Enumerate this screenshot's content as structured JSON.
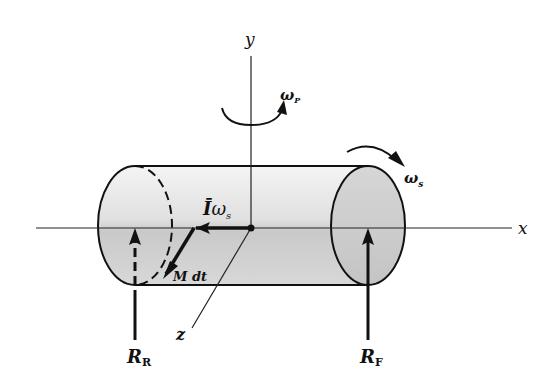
{
  "figure": {
    "axes": {
      "x_label": "x",
      "y_label": "y",
      "z_label": "z"
    },
    "vectors": {
      "angular_momentum": {
        "symbol": "Ī",
        "subscript_symbol": "ω",
        "subscript": "s"
      },
      "moment_impulse": {
        "label": "M dt"
      }
    },
    "rotations": {
      "precession": {
        "symbol": "ω",
        "subscript": "P"
      },
      "spin": {
        "symbol": "ω",
        "subscript": "s"
      }
    },
    "reactions": {
      "rear": {
        "symbol": "R",
        "subscript": "R"
      },
      "front": {
        "symbol": "R",
        "subscript": "F"
      }
    },
    "colors": {
      "ink": "#111111",
      "body_light": "#f2f2f2",
      "body_dark": "#bdbdbd",
      "end_cap": "#cfcfcf",
      "background": "#ffffff"
    }
  }
}
